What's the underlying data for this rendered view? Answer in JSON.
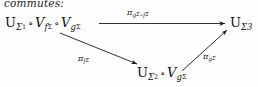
{
  "caption": "commutes:",
  "diagram": {
    "type": "commutative-diagram",
    "nodes": [
      {
        "id": "source",
        "label": "U_{Σ_1} ∘ V_{f_Σ} ∘ V_{g_Σ}",
        "parts": {
          "u": "U",
          "u_sub": "Σ",
          "u_subsub": "1",
          "op1": "∘",
          "v1": "V",
          "v1_sub": "f",
          "v1_subsub": "Σ",
          "op2": "∘",
          "v2": "V",
          "v2_sub": "g",
          "v2_subsub": "Σ"
        },
        "x": 5,
        "y": 16
      },
      {
        "id": "target",
        "label": "U_{Σ3}",
        "parts": {
          "u": "U",
          "u_sub": "Σ3"
        },
        "x": 230,
        "y": 16
      },
      {
        "id": "middle",
        "label": "U_{Σ_2} ∘ V_{g_Σ}",
        "parts": {
          "u": "U",
          "u_sub": "Σ",
          "u_subsub": "2",
          "op1": "∘",
          "v1": "V",
          "v1_sub": "g",
          "v1_subsub": "Σ"
        },
        "x": 137,
        "y": 66
      }
    ],
    "arrows": [
      {
        "id": "top",
        "from": "source",
        "to": "target",
        "label": "π_{g_Σ ∘ f_Σ}",
        "label_parts": {
          "pi": "π",
          "s1": "g",
          "s1sub": "Σ",
          "op": "∘",
          "s2": "f",
          "s2sub": "Σ"
        },
        "label_x": 127,
        "label_y": 9
      },
      {
        "id": "left-diagonal",
        "from": "source",
        "to": "middle",
        "label": "π_{f_Σ}",
        "label_parts": {
          "pi": "π",
          "s1": "f",
          "s1sub": "Σ"
        },
        "label_x": 78,
        "label_y": 55
      },
      {
        "id": "right-diagonal",
        "from": "middle",
        "to": "target",
        "label": "π_{g_Σ}",
        "label_parts": {
          "pi": "π",
          "s1": "g",
          "s1sub": "Σ"
        },
        "label_x": 203,
        "label_y": 53
      }
    ],
    "colors": {
      "ink": "#111111",
      "background": "#fefefe"
    }
  }
}
